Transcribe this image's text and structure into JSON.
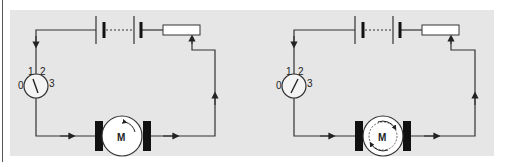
{
  "figure": {
    "colors": {
      "panel": "#e6e6e6",
      "wire": "#333333",
      "brush": "#111111",
      "component_fill": "#ffffff"
    }
  },
  "circuits": [
    {
      "id": "left",
      "meter": {
        "scale_labels": [
          "0",
          "1",
          "2",
          "3"
        ],
        "needle_reading": "1"
      },
      "motor": {
        "label": "M",
        "rotation": "single-arrow"
      }
    },
    {
      "id": "right",
      "meter": {
        "scale_labels": [
          "0",
          "1",
          "2",
          "3"
        ],
        "needle_reading": "2"
      },
      "motor": {
        "label": "M",
        "rotation": "double-arrow-dashed"
      }
    }
  ]
}
